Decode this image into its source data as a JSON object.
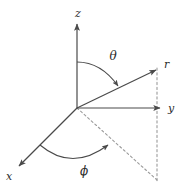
{
  "figure": {
    "background_color": "#ffffff",
    "line_color": "#4a4a4a",
    "dash_color": "#9a9a9a",
    "label_color": "#2b2b2b",
    "origin": {
      "x": 77,
      "y": 108
    }
  },
  "axes": [
    {
      "name": "z",
      "label": "z",
      "label_x": 78,
      "label_y": 13,
      "from": {
        "x": 77,
        "y": 108
      },
      "to": {
        "x": 77,
        "y": 22
      },
      "arrow": true,
      "style": "solid"
    },
    {
      "name": "y",
      "label": "y",
      "label_x": 172,
      "label_y": 112,
      "from": {
        "x": 77,
        "y": 108
      },
      "to": {
        "x": 162,
        "y": 108
      },
      "arrow": true,
      "style": "solid"
    },
    {
      "name": "x",
      "label": "x",
      "label_x": 8,
      "label_y": 179,
      "from": {
        "x": 77,
        "y": 108
      },
      "to": {
        "x": 17,
        "y": 168
      },
      "arrow": true,
      "style": "solid"
    },
    {
      "name": "r",
      "label": "r",
      "label_x": 167,
      "label_y": 67,
      "from": {
        "x": 77,
        "y": 108
      },
      "to": {
        "x": 158,
        "y": 68
      },
      "arrow": true,
      "style": "solid"
    }
  ],
  "dashed_lines": [
    {
      "name": "radius-projection-line",
      "from": {
        "x": 77,
        "y": 108
      },
      "to": {
        "x": 157,
        "y": 180
      }
    },
    {
      "name": "vertical-drop-line",
      "from": {
        "x": 157,
        "y": 68
      },
      "to": {
        "x": 157,
        "y": 182
      }
    }
  ],
  "angles": [
    {
      "name": "theta",
      "label": "θ",
      "label_x": 112,
      "label_y": 59,
      "description": "polar angle from z-axis to r",
      "arc_start": {
        "x": 77,
        "y": 62
      },
      "arc_end": {
        "x": 120,
        "y": 88
      },
      "arrow": true
    },
    {
      "name": "phi",
      "label": "ϕ",
      "label_x": 83,
      "label_y": 174,
      "description": "azimuthal angle from x-axis to projection",
      "arc_start": {
        "x": 40,
        "y": 145
      },
      "arc_end": {
        "x": 112,
        "y": 142
      },
      "arrow": true
    }
  ]
}
